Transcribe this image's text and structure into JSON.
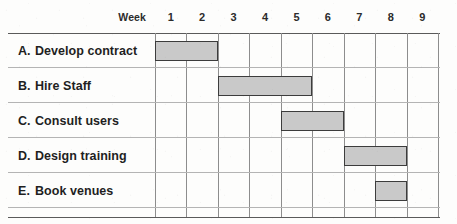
{
  "chart_data": {
    "type": "bar",
    "subtype": "gantt",
    "title": "",
    "xlabel": "Week",
    "ylabel": "",
    "x_axis_label": "Week",
    "categories": [
      "1",
      "2",
      "3",
      "4",
      "5",
      "6",
      "7",
      "8",
      "9"
    ],
    "xlim": [
      1,
      10
    ],
    "grid": true,
    "legend": "none",
    "tasks": [
      {
        "key": "A.",
        "label": "Develop contract",
        "start_week": 1,
        "end_week": 3,
        "duration_weeks": 2
      },
      {
        "key": "B.",
        "label": "Hire Staff",
        "start_week": 3,
        "end_week": 6,
        "duration_weeks": 3
      },
      {
        "key": "C.",
        "label": "Consult users",
        "start_week": 5,
        "end_week": 7,
        "duration_weeks": 2
      },
      {
        "key": "D.",
        "label": "Design training",
        "start_week": 7,
        "end_week": 9,
        "duration_weeks": 2
      },
      {
        "key": "E.",
        "label": "Book venues",
        "start_week": 8,
        "end_week": 9,
        "duration_weeks": 1
      }
    ],
    "colors": {
      "bar_fill": "#c9c9c9",
      "bar_border": "#3c3c3c",
      "grid_line": "#8d8d8d",
      "row_rule": "#b4b4b4",
      "frame_rule": "#5a5a5a",
      "background": "#fdfdfc",
      "text": "#1f1f1f"
    }
  }
}
